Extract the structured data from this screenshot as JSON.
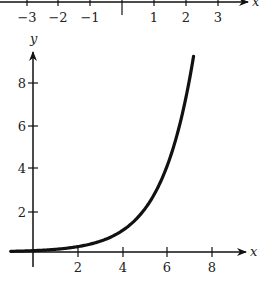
{
  "chart_data": [
    {
      "type": "number_line",
      "xlabel": "x",
      "ticks": [
        -3,
        -2,
        -1,
        0,
        1,
        2,
        3
      ],
      "tick_labels": [
        "−3",
        "−2",
        "−1",
        "",
        "1",
        "2",
        "3"
      ],
      "range": [
        -3.3,
        4
      ]
    },
    {
      "type": "line",
      "title": "",
      "xlabel": "x",
      "ylabel": "y",
      "function": "y = 2^(x-4)",
      "x": [
        -1,
        0,
        1,
        2,
        3,
        4,
        5,
        6,
        7,
        7.2
      ],
      "y": [
        0.03,
        0.06,
        0.13,
        0.25,
        0.5,
        1,
        2,
        4,
        8,
        9.2
      ],
      "xticks": [
        2,
        4,
        6,
        8
      ],
      "yticks": [
        2,
        4,
        6,
        8
      ],
      "xlim": [
        -0.1,
        9.5
      ],
      "ylim": [
        -0.8,
        9.6
      ],
      "grid": false,
      "legend": null
    }
  ],
  "labels": {
    "top_axis": {
      "x_var": "x",
      "ticks": [
        "−3",
        "−2",
        "−1",
        "1",
        "2",
        "3"
      ]
    },
    "graph": {
      "x_var": "x",
      "y_var": "y",
      "x_ticks": [
        "2",
        "4",
        "6",
        "8"
      ],
      "y_ticks": [
        "2",
        "4",
        "6",
        "8"
      ]
    }
  },
  "colors": {
    "ink": "#111111",
    "background": "#ffffff"
  }
}
